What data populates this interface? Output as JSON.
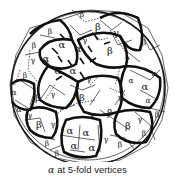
{
  "figure": {
    "labels": {
      "alpha": "α",
      "beta": "β",
      "gamma": "γ"
    },
    "label_positions": [
      {
        "t": "β",
        "x": 82,
        "y": 14,
        "s": 1
      },
      {
        "t": "β",
        "x": 98,
        "y": 26,
        "s": 0
      },
      {
        "t": "γ",
        "x": 116,
        "y": 32,
        "s": 0
      },
      {
        "t": "β",
        "x": 110,
        "y": 50,
        "s": 0
      },
      {
        "t": "β",
        "x": 144,
        "y": 42,
        "s": 1
      },
      {
        "t": "γ",
        "x": 127,
        "y": 58,
        "s": 1
      },
      {
        "t": "β",
        "x": 34,
        "y": 45,
        "s": 1
      },
      {
        "t": "β",
        "x": 50,
        "y": 31,
        "s": 1
      },
      {
        "t": "α",
        "x": 46,
        "y": 58,
        "s": 0
      },
      {
        "t": "α",
        "x": 62,
        "y": 44,
        "s": 0
      },
      {
        "t": "α",
        "x": 58,
        "y": 70,
        "s": 0
      },
      {
        "t": "α",
        "x": 73,
        "y": 70,
        "s": 0
      },
      {
        "t": "α",
        "x": 78,
        "y": 48,
        "s": 0
      },
      {
        "t": "γ",
        "x": 85,
        "y": 40,
        "s": 1
      },
      {
        "t": "γ",
        "x": 33,
        "y": 60,
        "s": 1
      },
      {
        "t": "β",
        "x": 25,
        "y": 75,
        "s": 1
      },
      {
        "t": "β",
        "x": 38,
        "y": 97,
        "s": 0
      },
      {
        "t": "γ",
        "x": 53,
        "y": 94,
        "s": 1
      },
      {
        "t": "β",
        "x": 82,
        "y": 97,
        "s": 0
      },
      {
        "t": "γ",
        "x": 89,
        "y": 79,
        "s": 1
      },
      {
        "t": "γ",
        "x": 120,
        "y": 97,
        "s": 1
      },
      {
        "t": "α",
        "x": 145,
        "y": 86,
        "s": 0
      },
      {
        "t": "α",
        "x": 131,
        "y": 80,
        "s": 1
      },
      {
        "t": "α",
        "x": 148,
        "y": 100,
        "s": 1
      },
      {
        "t": "β",
        "x": 157,
        "y": 114,
        "s": 1
      },
      {
        "t": "α",
        "x": 154,
        "y": 73,
        "s": 1
      },
      {
        "t": "α",
        "x": 14,
        "y": 92,
        "s": 1
      },
      {
        "t": "α",
        "x": 19,
        "y": 109,
        "s": 1
      },
      {
        "t": "γ",
        "x": 30,
        "y": 115,
        "s": 1
      },
      {
        "t": "β",
        "x": 39,
        "y": 124,
        "s": 0
      },
      {
        "t": "γ",
        "x": 53,
        "y": 124,
        "s": 1
      },
      {
        "t": "γ",
        "x": 92,
        "y": 115,
        "s": 1
      },
      {
        "t": "β",
        "x": 110,
        "y": 112,
        "s": 0
      },
      {
        "t": "β",
        "x": 128,
        "y": 125,
        "s": 0
      },
      {
        "t": "γ",
        "x": 140,
        "y": 119,
        "s": 1
      },
      {
        "t": "β",
        "x": 144,
        "y": 133,
        "s": 1
      },
      {
        "t": "α",
        "x": 70,
        "y": 130,
        "s": 0
      },
      {
        "t": "α",
        "x": 86,
        "y": 132,
        "s": 0
      },
      {
        "t": "α",
        "x": 74,
        "y": 145,
        "s": 0
      },
      {
        "t": "α",
        "x": 92,
        "y": 147,
        "s": 0
      },
      {
        "t": "γ",
        "x": 106,
        "y": 139,
        "s": 1
      },
      {
        "t": "β",
        "x": 120,
        "y": 144,
        "s": 1
      },
      {
        "t": "β",
        "x": 47,
        "y": 143,
        "s": 1
      },
      {
        "t": "β",
        "x": 57,
        "y": 153,
        "s": 1
      }
    ]
  },
  "caption": {
    "symbol": "α",
    "text": " at 5-fold vertices"
  }
}
